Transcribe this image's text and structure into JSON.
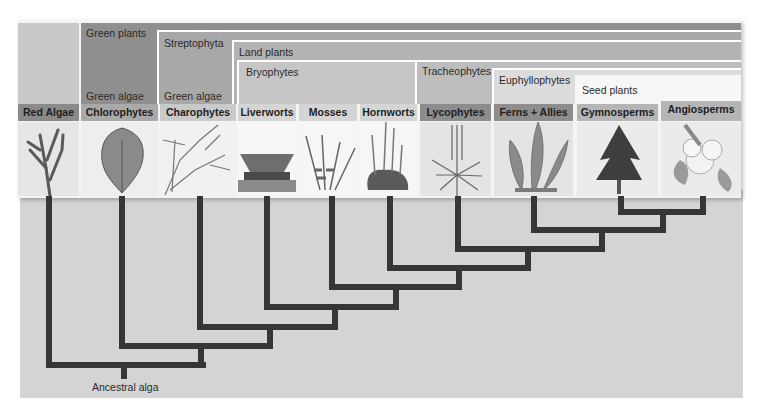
{
  "clades": {
    "green_plants": "Green plants",
    "green_algae_1": "Green algae",
    "streptophyta": "Streptophyta",
    "green_algae_2": "Green algae",
    "land_plants": "Land plants",
    "bryophytes": "Bryophytes",
    "tracheophytes": "Tracheophytes",
    "euphyllophytes": "Euphyllophytes",
    "seed_plants": "Seed plants"
  },
  "taxa": [
    {
      "label": "Red Algae",
      "icon": "red-algae-illustration"
    },
    {
      "label": "Chlorophytes",
      "icon": "chlorophyte-illustration"
    },
    {
      "label": "Charophytes",
      "icon": "charophyte-illustration"
    },
    {
      "label": "Liverworts",
      "icon": "liverwort-illustration"
    },
    {
      "label": "Mosses",
      "icon": "moss-illustration"
    },
    {
      "label": "Hornworts",
      "icon": "hornwort-illustration"
    },
    {
      "label": "Lycophytes",
      "icon": "lycophyte-illustration"
    },
    {
      "label": "Ferns + Allies",
      "icon": "fern-illustration"
    },
    {
      "label": "Gymnosperms",
      "icon": "conifer-tree-illustration"
    },
    {
      "label": "Angiosperms",
      "icon": "flower-illustration"
    }
  ],
  "root": {
    "label": "Ancestral alga"
  },
  "colors": {
    "tree_line": "#363636",
    "background": "#d4d4d4"
  }
}
